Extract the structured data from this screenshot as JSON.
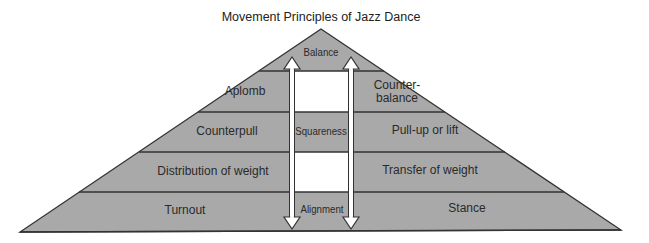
{
  "title": "Movement Principles of Jazz Dance",
  "colors": {
    "fill": "#a9a9a9",
    "line": "#333333",
    "white_box": "#ffffff",
    "text": "#2a2a2a"
  },
  "pyramid": {
    "apex": "Balance",
    "levels": [
      {
        "left": "Aplomb",
        "center": "",
        "right": "Counter-\nbalance"
      },
      {
        "left": "Counterpull",
        "center": "Squareness",
        "right": "Pull-up or lift"
      },
      {
        "left": "Distribution of weight",
        "center": "",
        "right": "Transfer of weight"
      },
      {
        "left": "Turnout",
        "center": "Alignment",
        "right": "Stance"
      }
    ],
    "right_level1_line1": "Counter-",
    "right_level1_line2": "balance"
  },
  "arrows": {
    "count": 2,
    "direction": "bidirectional-vertical"
  }
}
